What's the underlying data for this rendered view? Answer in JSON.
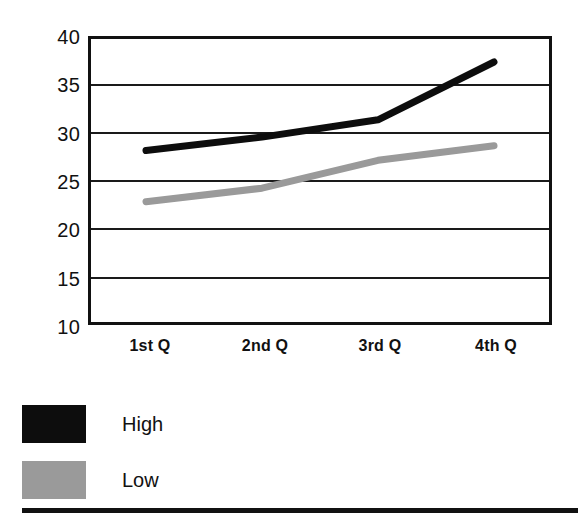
{
  "chart_data": {
    "type": "line",
    "title": "",
    "subtitle": "",
    "xlabel": "",
    "ylabel": "",
    "categories": [
      "1st Q",
      "2nd Q",
      "3rd Q",
      "4th Q"
    ],
    "series": [
      {
        "name": "High",
        "color": "#0d0d0d",
        "values": [
          28.1,
          29.5,
          31.3,
          37.3
        ]
      },
      {
        "name": "Low",
        "color": "#9a9a9a",
        "values": [
          22.8,
          24.2,
          27.1,
          28.6
        ]
      }
    ],
    "ylim": [
      10,
      40
    ],
    "yticks": [
      40,
      35,
      30,
      25,
      20,
      15,
      10
    ],
    "ytick_labels": [
      "40",
      "35",
      "30",
      "25",
      "20",
      "15",
      "10"
    ],
    "grid": true,
    "grid_axis": "y",
    "legend_position": "below-left",
    "legend": [
      {
        "label": "High",
        "swatch": "#0d0d0d"
      },
      {
        "label": "Low",
        "swatch": "#9a9a9a"
      }
    ]
  },
  "colors": {
    "axis": "#111111",
    "grid": "#1a1a1a",
    "background": "#ffffff",
    "high": "#0d0d0d",
    "low": "#9a9a9a",
    "rule": "#111111"
  }
}
